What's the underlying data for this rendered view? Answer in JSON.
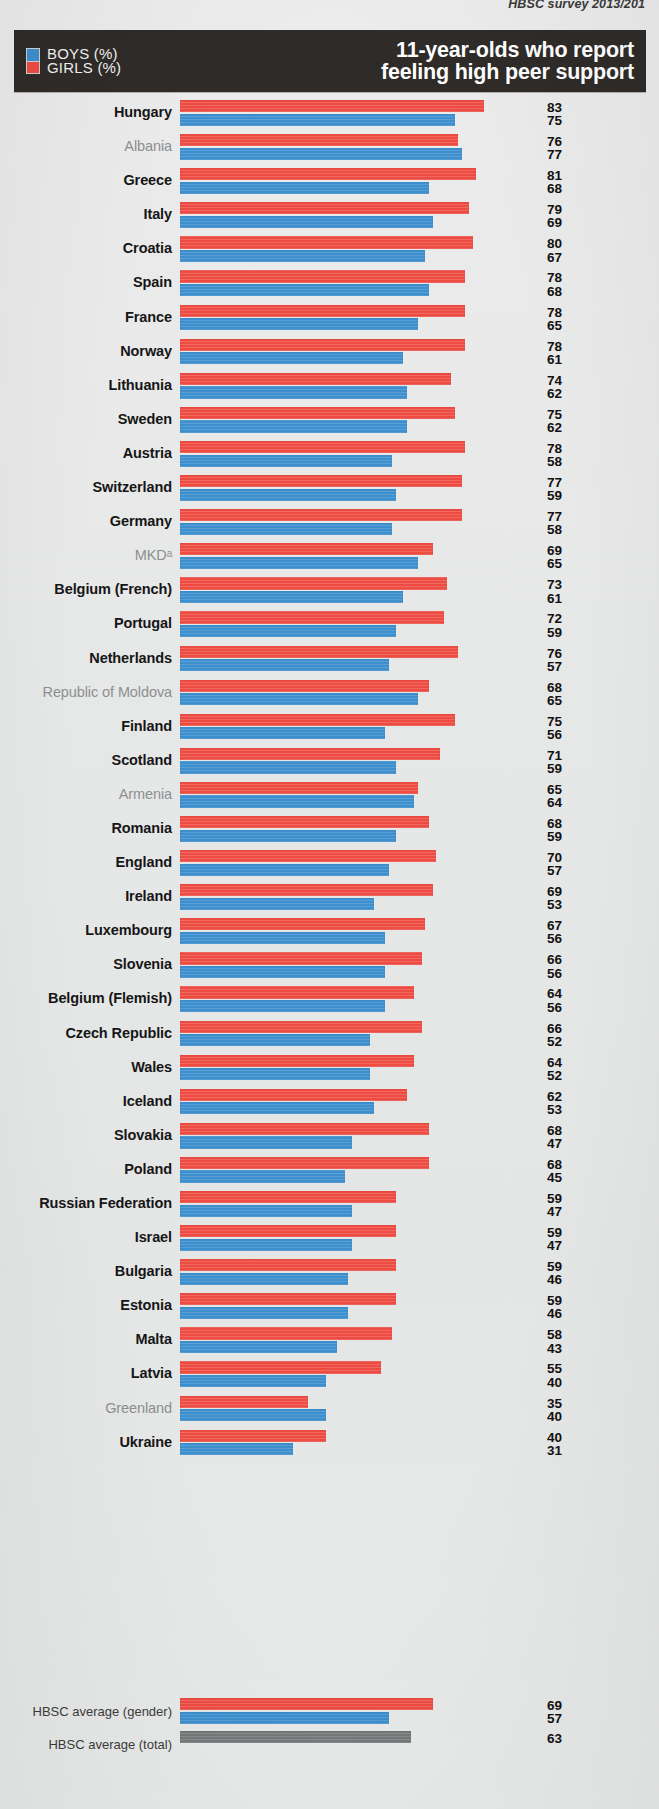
{
  "source_note": "HBSC survey 2013/201",
  "header": {
    "title_line1": "11-year-olds who report",
    "title_line2": "feeling high peer support",
    "legend": [
      {
        "key": "boys",
        "label": "BOYS (%)",
        "color": "#3d8fce"
      },
      {
        "key": "girls",
        "label": "GIRLS (%)",
        "color": "#ee4b42"
      }
    ]
  },
  "footer": {
    "gender_label": "HBSC average (gender)",
    "total_label": "HBSC average (total)",
    "gender_girls": 69,
    "gender_boys": 57,
    "total": 63,
    "total_color": "#76787a"
  },
  "chart_data": {
    "type": "bar",
    "orientation": "horizontal",
    "title": "11-year-olds who report feeling high peer support",
    "xlabel": "",
    "ylabel": "",
    "xlim": [
      0,
      100
    ],
    "grid": false,
    "legend_position": "top-left",
    "value_unit": "%",
    "sorted_by": "girls descending",
    "legend_entries": [
      "BOYS (%)",
      "GIRLS (%)"
    ],
    "annotations": [
      "MKDᵃ superscript a denotes footnote",
      "Non-bold grey labels are non-member/associate entities"
    ],
    "categories": [
      "Hungary",
      "Albania",
      "Greece",
      "Italy",
      "Croatia",
      "Spain",
      "France",
      "Norway",
      "Lithuania",
      "Sweden",
      "Austria",
      "Switzerland",
      "Germany",
      "MKDᵃ",
      "Belgium (French)",
      "Portugal",
      "Netherlands",
      "Republic of Moldova",
      "Finland",
      "Scotland",
      "Armenia",
      "Romania",
      "England",
      "Ireland",
      "Luxembourg",
      "Slovenia",
      "Belgium (Flemish)",
      "Czech Republic",
      "Wales",
      "Iceland",
      "Slovakia",
      "Poland",
      "Russian Federation",
      "Israel",
      "Bulgaria",
      "Estonia",
      "Malta",
      "Latvia",
      "Greenland",
      "Ukraine"
    ],
    "series": [
      {
        "name": "GIRLS (%)",
        "color": "#ee4b42",
        "values": [
          83,
          76,
          81,
          79,
          80,
          78,
          78,
          78,
          74,
          75,
          78,
          77,
          77,
          69,
          73,
          72,
          76,
          68,
          75,
          71,
          65,
          68,
          70,
          69,
          67,
          66,
          64,
          66,
          64,
          62,
          68,
          68,
          59,
          59,
          59,
          59,
          58,
          55,
          35,
          40
        ]
      },
      {
        "name": "BOYS (%)",
        "color": "#3d8fce",
        "values": [
          75,
          77,
          68,
          69,
          67,
          68,
          65,
          61,
          62,
          62,
          58,
          59,
          58,
          65,
          61,
          59,
          57,
          65,
          56,
          59,
          64,
          59,
          57,
          53,
          56,
          56,
          56,
          52,
          52,
          53,
          47,
          45,
          47,
          47,
          46,
          46,
          43,
          40,
          40,
          31
        ]
      }
    ],
    "averages": {
      "girls": 69,
      "boys": 57,
      "total": 63
    }
  },
  "rows": [
    {
      "name": "Hungary",
      "girls": 83,
      "boys": 75,
      "muted": false
    },
    {
      "name": "Albania",
      "girls": 76,
      "boys": 77,
      "muted": true
    },
    {
      "name": "Greece",
      "girls": 81,
      "boys": 68,
      "muted": false
    },
    {
      "name": "Italy",
      "girls": 79,
      "boys": 69,
      "muted": false
    },
    {
      "name": "Croatia",
      "girls": 80,
      "boys": 67,
      "muted": false
    },
    {
      "name": "Spain",
      "girls": 78,
      "boys": 68,
      "muted": false
    },
    {
      "name": "France",
      "girls": 78,
      "boys": 65,
      "muted": false
    },
    {
      "name": "Norway",
      "girls": 78,
      "boys": 61,
      "muted": false
    },
    {
      "name": "Lithuania",
      "girls": 74,
      "boys": 62,
      "muted": false
    },
    {
      "name": "Sweden",
      "girls": 75,
      "boys": 62,
      "muted": false
    },
    {
      "name": "Austria",
      "girls": 78,
      "boys": 58,
      "muted": false
    },
    {
      "name": "Switzerland",
      "girls": 77,
      "boys": 59,
      "muted": false
    },
    {
      "name": "Germany",
      "girls": 77,
      "boys": 58,
      "muted": false
    },
    {
      "name": "MKDᵃ",
      "girls": 69,
      "boys": 65,
      "muted": true
    },
    {
      "name": "Belgium (French)",
      "girls": 73,
      "boys": 61,
      "muted": false
    },
    {
      "name": "Portugal",
      "girls": 72,
      "boys": 59,
      "muted": false
    },
    {
      "name": "Netherlands",
      "girls": 76,
      "boys": 57,
      "muted": false
    },
    {
      "name": "Republic of Moldova",
      "girls": 68,
      "boys": 65,
      "muted": true
    },
    {
      "name": "Finland",
      "girls": 75,
      "boys": 56,
      "muted": false
    },
    {
      "name": "Scotland",
      "girls": 71,
      "boys": 59,
      "muted": false
    },
    {
      "name": "Armenia",
      "girls": 65,
      "boys": 64,
      "muted": true
    },
    {
      "name": "Romania",
      "girls": 68,
      "boys": 59,
      "muted": false
    },
    {
      "name": "England",
      "girls": 70,
      "boys": 57,
      "muted": false
    },
    {
      "name": "Ireland",
      "girls": 69,
      "boys": 53,
      "muted": false
    },
    {
      "name": "Luxembourg",
      "girls": 67,
      "boys": 56,
      "muted": false
    },
    {
      "name": "Slovenia",
      "girls": 66,
      "boys": 56,
      "muted": false
    },
    {
      "name": "Belgium (Flemish)",
      "girls": 64,
      "boys": 56,
      "muted": false
    },
    {
      "name": "Czech Republic",
      "girls": 66,
      "boys": 52,
      "muted": false
    },
    {
      "name": "Wales",
      "girls": 64,
      "boys": 52,
      "muted": false
    },
    {
      "name": "Iceland",
      "girls": 62,
      "boys": 53,
      "muted": false
    },
    {
      "name": "Slovakia",
      "girls": 68,
      "boys": 47,
      "muted": false
    },
    {
      "name": "Poland",
      "girls": 68,
      "boys": 45,
      "muted": false
    },
    {
      "name": "Russian Federation",
      "girls": 59,
      "boys": 47,
      "muted": false
    },
    {
      "name": "Israel",
      "girls": 59,
      "boys": 47,
      "muted": false
    },
    {
      "name": "Bulgaria",
      "girls": 59,
      "boys": 46,
      "muted": false
    },
    {
      "name": "Estonia",
      "girls": 59,
      "boys": 46,
      "muted": false
    },
    {
      "name": "Malta",
      "girls": 58,
      "boys": 43,
      "muted": false
    },
    {
      "name": "Latvia",
      "girls": 55,
      "boys": 40,
      "muted": false
    },
    {
      "name": "Greenland",
      "girls": 35,
      "boys": 40,
      "muted": true
    },
    {
      "name": "Ukraine",
      "girls": 40,
      "boys": 31,
      "muted": false
    }
  ]
}
